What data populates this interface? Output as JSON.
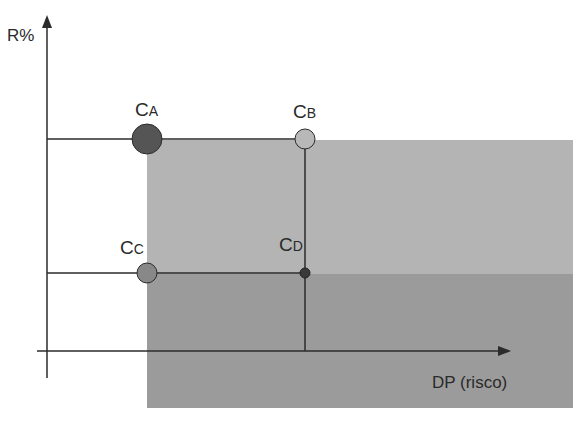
{
  "axes": {
    "y_label": "R%",
    "x_label": "DP (risco)"
  },
  "points": [
    {
      "id": "A",
      "main": "C",
      "sub": "A"
    },
    {
      "id": "B",
      "main": "C",
      "sub": "B"
    },
    {
      "id": "C",
      "main": "C",
      "sub": "C"
    },
    {
      "id": "D",
      "main": "C",
      "sub": "D"
    }
  ],
  "colors": {
    "axis": "#2b2b2b",
    "region_upper": "#b4b4b4",
    "region_lower": "#9a9a9a",
    "point_a": "#555555",
    "point_b": "#b8b8b8",
    "point_c": "#888888",
    "point_d": "#3a3a3a"
  }
}
